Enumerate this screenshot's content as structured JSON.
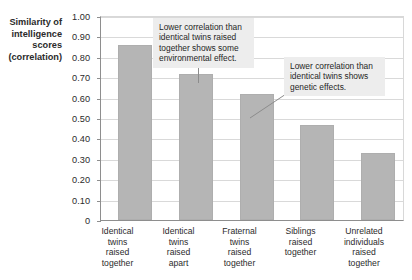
{
  "chart_data": {
    "type": "bar",
    "title": "",
    "subtitle": "",
    "xlabel": "",
    "ylabel": "Similarity of intelligence scores (correlation)",
    "ylim": [
      0,
      1.0
    ],
    "grid": true,
    "legend_position": "none",
    "categories": [
      "Identical twins raised together",
      "Identical twins raised apart",
      "Fraternal twins raised together",
      "Siblings raised together",
      "Unrelated individuals raised together"
    ],
    "values": [
      0.86,
      0.72,
      0.62,
      0.47,
      0.33
    ],
    "bar_color": "#b5b5b5",
    "annotations": [
      "Lower correlation than identical twins raised together shows some environmental effect.",
      "Lower correlation than identical twins shows genetic effects."
    ]
  },
  "y_axis": {
    "title_lines": [
      "Similarity of",
      "intelligence",
      "scores",
      "(correlation)"
    ],
    "tick_labels": [
      "1.00",
      "0.90",
      "0.80",
      "0.70",
      "0.60",
      "0.50",
      "0.40",
      "0.30",
      "0.20",
      "0.10",
      "0"
    ],
    "tick_values": [
      1.0,
      0.9,
      0.8,
      0.7,
      0.6,
      0.5,
      0.4,
      0.3,
      0.2,
      0.1,
      0
    ]
  },
  "x_axis": {
    "categories": [
      {
        "lines": [
          "Identical",
          "twins",
          "raised",
          "together"
        ]
      },
      {
        "lines": [
          "Identical",
          "twins",
          "raised",
          "apart"
        ]
      },
      {
        "lines": [
          "Fraternal",
          "twins",
          "raised",
          "together"
        ]
      },
      {
        "lines": [
          "Siblings",
          "raised",
          "together"
        ]
      },
      {
        "lines": [
          "Unrelated",
          "individuals",
          "raised",
          "together"
        ]
      }
    ]
  },
  "callouts": [
    {
      "lines": [
        "Lower correlation than",
        "identical twins raised",
        "together shows some",
        "environmental effect."
      ]
    },
    {
      "lines": [
        "Lower correlation than",
        "identical twins shows",
        "genetic effects."
      ]
    }
  ]
}
